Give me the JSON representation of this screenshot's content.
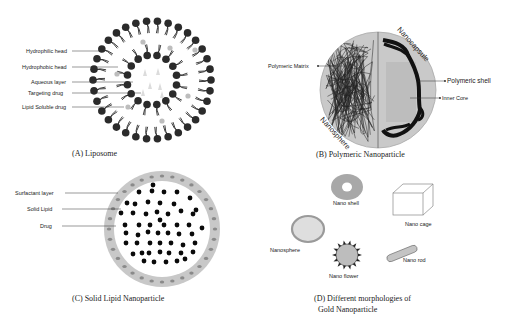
{
  "panels": {
    "a": {
      "caption": "(A) Liposome",
      "labels": [
        "Hydrophilic head",
        "Hydrophobic head",
        "Aqueous layer",
        "Targeting drug",
        "Lipid Soluble drug"
      ]
    },
    "b": {
      "caption": "(B) Polymeric Nanoparticle",
      "labels": {
        "matrix": "Polymeric Matrix",
        "shell": "Polymeric shell",
        "core": "Inner Core",
        "nanocapsule": "Nanocapsule",
        "nanosphere": "Nanosphere"
      }
    },
    "c": {
      "caption": "(C) Solid Lipid Nanoparticle",
      "labels": [
        "Surfactant layer",
        "Solid Lipid",
        "Drug"
      ]
    },
    "d": {
      "caption_line1": "(D) Different morphologies  of",
      "caption_line2": "Gold Nanoparticle",
      "labels": {
        "shell": "Nano shell",
        "cage": "Nano cage",
        "sphere": "Nanosphere",
        "flower": "Nano flower",
        "rod": "Nano rod"
      }
    }
  },
  "colors": {
    "dark": "#2b2b2b",
    "grey": "#b8b8b8",
    "light_grey": "#d4d4d4"
  }
}
